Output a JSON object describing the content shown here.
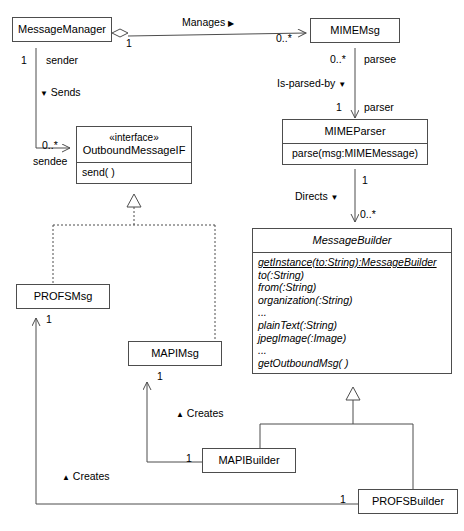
{
  "diagram": {
    "type": "uml-class-diagram",
    "width": 464,
    "height": 531,
    "background": "#ffffff",
    "line_color": "#4d4d4d"
  },
  "classes": {
    "message_manager": {
      "name": "MessageManager"
    },
    "mime_msg": {
      "name": "MIMEMsg"
    },
    "outbound_message_if": {
      "stereotype": "«interface»",
      "name": "OutboundMessageIF",
      "operations": [
        "send( )"
      ]
    },
    "mime_parser": {
      "name": "MIMEParser",
      "operations": [
        "parse(msg:MIMEMessage)"
      ]
    },
    "message_builder": {
      "name": "MessageBuilder",
      "operations": [
        "getInstance(to:String):MessageBuilder",
        "to(:String)",
        "from(:String)",
        "organization(:String)",
        "...",
        "plainText(:String)",
        "jpegImage(:Image)",
        "...",
        "getOutboundMsg( )"
      ]
    },
    "profs_msg": {
      "name": "PROFSMsg"
    },
    "mapi_msg": {
      "name": "MAPIMsg"
    },
    "mapi_builder": {
      "name": "MAPIBuilder"
    },
    "profs_builder": {
      "name": "PROFSBuilder"
    }
  },
  "relationships": {
    "manages": {
      "label": "Manages",
      "direction_marker": "▶",
      "source_mult": "1",
      "target_mult": "0..*"
    },
    "sends": {
      "label": "Sends",
      "direction_marker": "▼",
      "source_mult": "1",
      "source_role": "sender",
      "target_mult": "0..*",
      "target_role": "sendee"
    },
    "is_parsed_by": {
      "label": "Is-parsed-by",
      "direction_marker": "▼",
      "source_mult": "0..*",
      "source_role": "parsee",
      "target_mult": "1",
      "target_role": "parser"
    },
    "directs": {
      "label": "Directs",
      "direction_marker": "▼",
      "source_mult": "1",
      "target_mult": "0..*"
    },
    "creates_mapi": {
      "label": "Creates",
      "direction_marker": "▲",
      "mult": "1"
    },
    "creates_profs": {
      "label": "Creates",
      "direction_marker": "▲",
      "mult": "1"
    }
  }
}
